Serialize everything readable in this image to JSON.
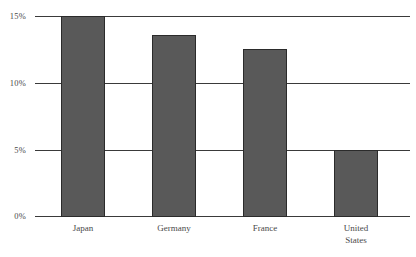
{
  "chart_data": {
    "type": "bar",
    "title": "",
    "xlabel": "",
    "ylabel": "",
    "categories": [
      "Japan",
      "Germany",
      "France",
      "United States"
    ],
    "values": [
      15.0,
      13.6,
      12.5,
      5.0
    ],
    "ylim": [
      0,
      15
    ],
    "ytick_values": [
      0,
      5,
      10,
      15
    ],
    "ytick_labels": [
      "0%",
      "5%",
      "10%",
      "15%"
    ],
    "grid": true,
    "legend": false,
    "series": [
      {
        "name": "",
        "values": [
          15.0,
          13.6,
          12.5,
          5.0
        ]
      }
    ],
    "value_format": "percent",
    "bar_color": "#595959",
    "bar_border_color": "#2b2b2b",
    "axis_color": "#3a3a3a",
    "background": "#ffffff"
  },
  "axis": {
    "y_ticks": [
      {
        "label": "15%",
        "value": 15
      },
      {
        "label": "10%",
        "value": 10
      },
      {
        "label": "5%",
        "value": 5
      },
      {
        "label": "0%",
        "value": 0
      }
    ]
  },
  "categories": [
    {
      "lines": [
        "Japan"
      ]
    },
    {
      "lines": [
        "Germany"
      ]
    },
    {
      "lines": [
        "France"
      ]
    },
    {
      "lines": [
        "United",
        "States"
      ]
    }
  ]
}
